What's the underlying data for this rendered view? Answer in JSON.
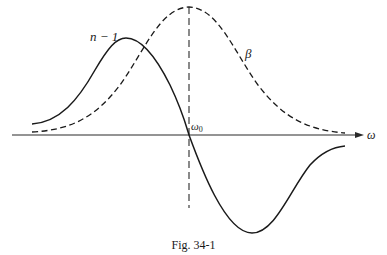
{
  "figure": {
    "caption": "Fig. 34-1",
    "labels": {
      "n_minus_1": "n − 1",
      "beta": "β",
      "omega0_base": "ω",
      "omega0_sub": "0",
      "omega_axis": "ω"
    },
    "colors": {
      "ink": "#1a1a1a",
      "background": "#ffffff"
    },
    "curves": [
      {
        "name": "n − 1",
        "style": "solid",
        "shape": "dispersive (rises to max left of ω0, crosses zero at ω0, minimum right of ω0)"
      },
      {
        "name": "β",
        "style": "dashed",
        "shape": "absorption peak (bell-shaped, maximum at ω0)"
      }
    ],
    "axis": {
      "horizontal_label": "ω",
      "vertical_marker_label": "ω0",
      "vertical_marker_style": "dashed"
    }
  }
}
